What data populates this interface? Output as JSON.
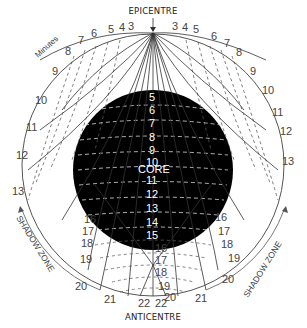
{
  "diagram": {
    "labels": {
      "epicentre": "EPICENTRE",
      "anticentre": "ANTICENTRE",
      "minutes": "Minutes",
      "core": "CORE",
      "shadow_zone_left": "SHADOW ZONE",
      "shadow_zone_right": "SHADOW ZONE"
    },
    "surface_minutes_left": [
      "3",
      "4",
      "5",
      "6",
      "7",
      "8",
      "9",
      "10",
      "11",
      "12",
      "13"
    ],
    "surface_minutes_right": [
      "3",
      "4",
      "5",
      "6",
      "7",
      "8",
      "9",
      "10",
      "11",
      "12",
      "13"
    ],
    "core_minutes": [
      "5",
      "6",
      "7",
      "8",
      "9",
      "10",
      "11",
      "12",
      "13",
      "14",
      "15",
      "16",
      "17",
      "18",
      "19",
      "20"
    ],
    "lower_left_minutes": [
      "16",
      "17",
      "18",
      "19",
      "20",
      "21",
      "22"
    ],
    "lower_right_minutes": [
      "16",
      "17",
      "18",
      "19",
      "20",
      "21",
      "22"
    ],
    "colors": {
      "background": "#ffffff",
      "core": "#000000",
      "lines": "#444444",
      "text": "#333333"
    }
  }
}
